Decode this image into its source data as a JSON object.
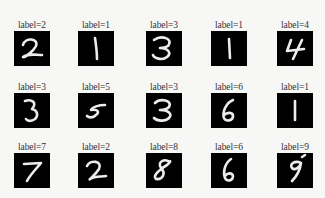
{
  "figure": {
    "rows": [
      [
        {
          "label": "label=2",
          "digit": 2
        },
        {
          "label": "label=1",
          "digit": 1
        },
        {
          "label": "label=3",
          "digit": 3
        },
        {
          "label": "label=1",
          "digit": 1
        },
        {
          "label": "label=4",
          "digit": 4
        }
      ],
      [
        {
          "label": "label=3",
          "digit": 3
        },
        {
          "label": "label=5",
          "digit": 5
        },
        {
          "label": "label=3",
          "digit": 3
        },
        {
          "label": "label=6",
          "digit": 6
        },
        {
          "label": "label=1",
          "digit": 1
        }
      ],
      [
        {
          "label": "label=7",
          "digit": 7
        },
        {
          "label": "label=2",
          "digit": 2
        },
        {
          "label": "label=8",
          "digit": 8
        },
        {
          "label": "label=6",
          "digit": 6
        },
        {
          "label": "label=9",
          "digit": 9
        }
      ]
    ],
    "colors": {
      "background": "#f7f7f6",
      "tile": "#000000",
      "stroke": "#ececec",
      "text": "#333333"
    }
  }
}
